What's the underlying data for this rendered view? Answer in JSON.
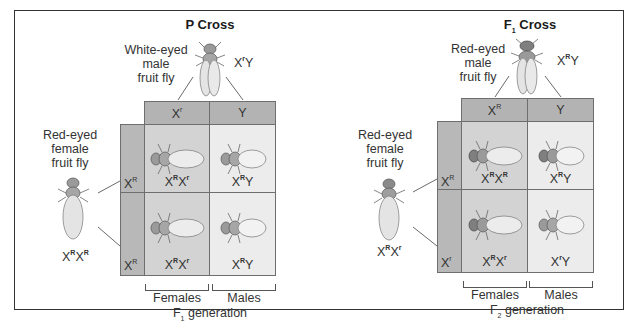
{
  "p_cross": {
    "title": "P Cross",
    "male_parent": {
      "label_lines": [
        "White-eyed",
        "male",
        "fruit fly"
      ],
      "genotype_base": "X",
      "genotype_sup": "r",
      "genotype_tail": "Y"
    },
    "female_parent": {
      "label_lines": [
        "Red-eyed",
        "female",
        "fruit fly"
      ],
      "genotype": [
        {
          "b": "X",
          "s": "R"
        },
        {
          "b": "X",
          "s": "R"
        }
      ]
    },
    "column_headers": [
      {
        "b": "X",
        "s": "r"
      },
      {
        "b": "Y",
        "s": ""
      }
    ],
    "row_headers": [
      {
        "b": "X",
        "s": "R"
      },
      {
        "b": "X",
        "s": "R"
      }
    ],
    "cells": [
      [
        {
          "g": [
            {
              "b": "X",
              "s": "R"
            },
            {
              "b": "X",
              "s": "r"
            }
          ],
          "sex": "female"
        },
        {
          "g": [
            {
              "b": "X",
              "s": "R"
            },
            {
              "b": "Y",
              "s": ""
            }
          ],
          "sex": "male"
        }
      ],
      [
        {
          "g": [
            {
              "b": "X",
              "s": "R"
            },
            {
              "b": "X",
              "s": "r"
            }
          ],
          "sex": "female"
        },
        {
          "g": [
            {
              "b": "X",
              "s": "R"
            },
            {
              "b": "Y",
              "s": ""
            }
          ],
          "sex": "male"
        }
      ]
    ],
    "females_label": "Females",
    "males_label": "Males",
    "generation_label": "F",
    "generation_sub": "1",
    "generation_tail": " generation"
  },
  "f1_cross": {
    "title": "F",
    "title_sub": "1",
    "title_tail": " Cross",
    "male_parent": {
      "label_lines": [
        "Red-eyed",
        "male",
        "fruit fly"
      ],
      "genotype_base": "X",
      "genotype_sup": "R",
      "genotype_tail": "Y"
    },
    "female_parent": {
      "label_lines": [
        "Red-eyed",
        "female",
        "fruit fly"
      ],
      "genotype": [
        {
          "b": "X",
          "s": "R"
        },
        {
          "b": "X",
          "s": "r"
        }
      ]
    },
    "column_headers": [
      {
        "b": "X",
        "s": "R"
      },
      {
        "b": "Y",
        "s": ""
      }
    ],
    "row_headers": [
      {
        "b": "X",
        "s": "R"
      },
      {
        "b": "X",
        "s": "r"
      }
    ],
    "cells": [
      [
        {
          "g": [
            {
              "b": "X",
              "s": "R"
            },
            {
              "b": "X",
              "s": "R"
            }
          ],
          "sex": "female"
        },
        {
          "g": [
            {
              "b": "X",
              "s": "R"
            },
            {
              "b": "Y",
              "s": ""
            }
          ],
          "sex": "male"
        }
      ],
      [
        {
          "g": [
            {
              "b": "X",
              "s": "R"
            },
            {
              "b": "X",
              "s": "r"
            }
          ],
          "sex": "female"
        },
        {
          "g": [
            {
              "b": "X",
              "s": "r"
            },
            {
              "b": "Y",
              "s": ""
            }
          ],
          "sex": "male"
        }
      ]
    ],
    "females_label": "Females",
    "males_label": "Males",
    "generation_label": "F",
    "generation_sub": "2",
    "generation_tail": " generation"
  },
  "colors": {
    "header_fill": "#b3b3b3",
    "female_cell": "#d3d3d3",
    "male_cell": "#ececec",
    "grid_line": "#6e6e6e"
  }
}
